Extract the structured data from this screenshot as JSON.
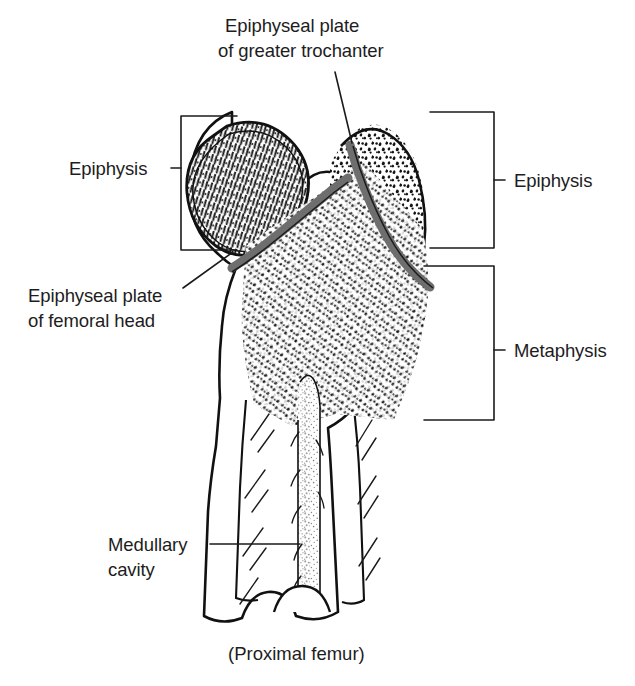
{
  "figure": {
    "title_caption": "(Proximal femur)",
    "background_color": "#ffffff",
    "ink_color": "#1a1a1a",
    "plate_color": "#6e6e6e"
  },
  "labels": {
    "trochanter_plate": {
      "line1": "Epiphyseal plate",
      "line2": "of greater trochanter"
    },
    "epiphysis_left": "Epiphysis",
    "femoral_head_plate": {
      "line1": "Epiphyseal plate",
      "line2": "of femoral head"
    },
    "medullary_cavity": {
      "line1": "Medullary",
      "line2": "cavity"
    },
    "epiphysis_right": "Epiphysis",
    "metaphysis_right": "Metaphysis"
  },
  "structures": [
    {
      "name": "femoral-head",
      "description": "rounded epiphysis upper left with radiating trabeculae"
    },
    {
      "name": "greater-trochanter",
      "description": "epiphysis upper right with mottled trabeculae"
    },
    {
      "name": "epiphyseal-plate-femoral-head",
      "description": "dark gray growth plate band below femoral head"
    },
    {
      "name": "epiphyseal-plate-greater-trochanter",
      "description": "dark gray growth plate band below greater trochanter"
    },
    {
      "name": "metaphysis",
      "description": "dense spongy bone region below the growth plates"
    },
    {
      "name": "medullary-cavity",
      "description": "stippled central marrow canal in the diaphysis"
    },
    {
      "name": "cortical-bone",
      "description": "thick compact bone walls of the shaft with diagonal hatching"
    }
  ]
}
